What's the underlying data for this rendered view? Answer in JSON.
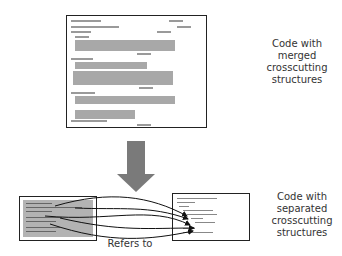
{
  "top_panel": {
    "caption_lines": [
      "Code with",
      "merged",
      "crosscutting",
      "structures"
    ]
  },
  "transform_arrow": {
    "color": "#7a7a7a",
    "direction": "down"
  },
  "bottom_left_panel": {
    "description": "extracted crosscutting code",
    "fill": "#b3b3b3"
  },
  "bottom_right_panel": {
    "caption_lines": [
      "Code with",
      "separated",
      "crosscutting",
      "structures"
    ]
  },
  "reference_label": "Refers to",
  "colors": {
    "border": "#222222",
    "highlight": "#a8a8a8",
    "text": "#333333"
  }
}
